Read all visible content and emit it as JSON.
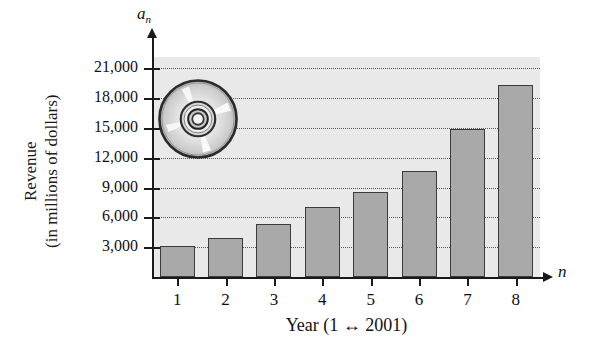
{
  "chart_data": {
    "type": "bar",
    "title": "",
    "subtitle": "",
    "xlabel": "Year (1 ↔ 2001)",
    "ylabel": "Revenue (in millions of dollars)",
    "ylabel_line1": "Revenue",
    "ylabel_line2": "(in millions of dollars)",
    "x_axis_variable": "n",
    "y_axis_variable": "a",
    "y_axis_variable_subscript": "n",
    "categories": [
      "1",
      "2",
      "3",
      "4",
      "5",
      "6",
      "7",
      "8"
    ],
    "values": [
      3100,
      3900,
      5300,
      7000,
      8600,
      10700,
      14900,
      19300
    ],
    "xlim": [
      0.4,
      8.8
    ],
    "ylim": [
      0,
      22200
    ],
    "y_ticks": [
      3000,
      6000,
      9000,
      12000,
      15000,
      18000,
      21000
    ],
    "y_tick_labels": [
      "3,000",
      "6,000",
      "9,000",
      "12,000",
      "15,000",
      "18,000",
      "21,000"
    ],
    "x_ticks": [
      1,
      2,
      3,
      4,
      5,
      6,
      7,
      8
    ],
    "x_tick_labels": [
      "1",
      "2",
      "3",
      "4",
      "5",
      "6",
      "7",
      "8"
    ],
    "grid": true,
    "grid_style": "dotted",
    "grid_axis": "y",
    "legend": false,
    "legend_position": "none",
    "annotations": [
      {
        "name": "cd-disc-illustration",
        "description": "compact disc / DVD photograph overlay",
        "x_center": 197,
        "y_center": 119
      }
    ]
  },
  "style": {
    "bar_fill": "#a9a9a9",
    "bar_edge": "#3b3b3b",
    "plot_background": "#e9e9e9",
    "page_background": "#ffffff",
    "axis_color": "#1a1a1a",
    "grid_color": "#58585a",
    "text_color": "#111111"
  }
}
